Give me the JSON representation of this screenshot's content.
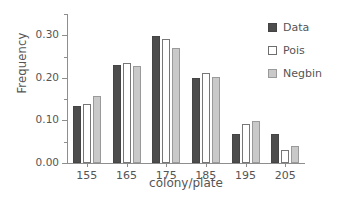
{
  "chart_data": {
    "type": "bar",
    "title": "",
    "xlabel": "colony/plate",
    "ylabel": "Frequency",
    "categories": [
      "155",
      "165",
      "175",
      "185",
      "195",
      "205"
    ],
    "series": [
      {
        "name": "Data",
        "color": "#4d4d4d",
        "values": [
          0.133,
          0.231,
          0.299,
          0.2,
          0.068,
          0.068
        ]
      },
      {
        "name": "Pois",
        "color": "#ffffff",
        "values": [
          0.139,
          0.235,
          0.292,
          0.211,
          0.091,
          0.03
        ]
      },
      {
        "name": "Negbin",
        "color": "#c9c9c9",
        "values": [
          0.158,
          0.227,
          0.271,
          0.203,
          0.099,
          0.041
        ]
      }
    ],
    "ylim": [
      0.0,
      0.35
    ],
    "yticks": [
      0.0,
      0.1,
      0.2,
      0.3
    ],
    "ytick_labels": [
      "0.00",
      "0.10",
      "0.20",
      "0.30"
    ],
    "yminor_ticks": [
      0.05,
      0.15,
      0.25,
      0.35
    ],
    "grid": false,
    "legend_position": "right-top"
  },
  "legend": {
    "entries": [
      {
        "label": "Data",
        "style": "filled-dark"
      },
      {
        "label": "Pois",
        "style": "open-white"
      },
      {
        "label": "Negbin",
        "style": "filled-light"
      }
    ]
  },
  "caption_strip": ""
}
